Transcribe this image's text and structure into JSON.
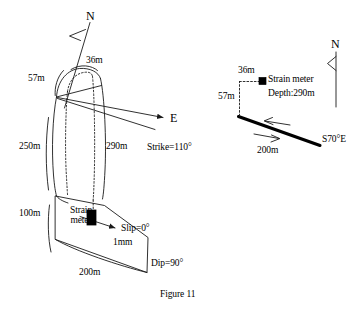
{
  "figure": {
    "caption": "Figure 11",
    "stroke_color": "#1a1a1a",
    "fill_color": "#ffffff",
    "accent_color": "#000000"
  },
  "left_panel": {
    "north_label": "N",
    "east_label": "E",
    "top_width_label": "36m",
    "top_offset_label": "57m",
    "left_depth_label": "250m",
    "right_depth_label": "290m",
    "lower_height_label": "100m",
    "bottom_length_label": "200m",
    "strike_label": "Strike=110°",
    "dip_label": "Dip=90°",
    "slip_label": "Slip=0°",
    "slip_amount_label": "1mm",
    "strain_meter_label_line1": "Strain",
    "strain_meter_label_line2": "meter"
  },
  "right_panel": {
    "north_label": "N",
    "top_width_label": "36m",
    "left_offset_label": "57m",
    "strain_meter_label": "Strain meter",
    "depth_label": "Depth:290m",
    "fault_length_label": "200m",
    "bearing_label": "S70°E"
  }
}
